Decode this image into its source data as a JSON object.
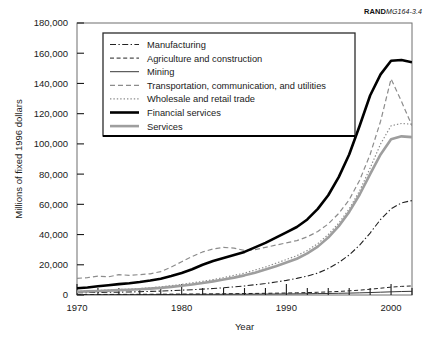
{
  "credit": {
    "brand": "RAND",
    "code": "MG164-3.4"
  },
  "chart_data": {
    "type": "line",
    "title": "",
    "xlabel": "Year",
    "ylabel": "Millions of fixed 1996 dollars",
    "xlim": [
      1970,
      2002
    ],
    "ylim": [
      0,
      180000
    ],
    "xticks": [
      1970,
      1980,
      1990,
      2000
    ],
    "xtick_labels": [
      "1970",
      "1980",
      "1990",
      "2000"
    ],
    "xminor_step": 2,
    "yticks": [
      0,
      20000,
      40000,
      60000,
      80000,
      100000,
      120000,
      140000,
      160000,
      180000
    ],
    "ytick_labels": [
      "0",
      "20,000",
      "40,000",
      "60,000",
      "80,000",
      "100,000",
      "120,000",
      "140,000",
      "160,000",
      "180,000"
    ],
    "grid": false,
    "legend_position": "upper-left-inset",
    "x": [
      1970,
      1971,
      1972,
      1973,
      1974,
      1975,
      1976,
      1977,
      1978,
      1979,
      1980,
      1981,
      1982,
      1983,
      1984,
      1985,
      1986,
      1987,
      1988,
      1989,
      1990,
      1991,
      1992,
      1993,
      1994,
      1995,
      1996,
      1997,
      1998,
      1999,
      2000,
      2001,
      2002
    ],
    "series": [
      {
        "name": "Manufacturing",
        "style": "dash-dot",
        "color": "#222222",
        "width": 1.1,
        "values": [
          1500,
          1600,
          1700,
          1800,
          1900,
          2000,
          2200,
          2400,
          2600,
          2900,
          3200,
          3500,
          3900,
          4300,
          4800,
          5400,
          6000,
          6800,
          7600,
          8600,
          9700,
          11000,
          12500,
          14500,
          17500,
          21500,
          26500,
          33000,
          41000,
          50000,
          57000,
          61000,
          62500
        ]
      },
      {
        "name": "Agriculture and construction",
        "style": "dashed",
        "color": "#222222",
        "width": 1.0,
        "values": [
          300,
          320,
          350,
          380,
          400,
          430,
          460,
          500,
          540,
          580,
          620,
          660,
          700,
          760,
          820,
          880,
          950,
          1030,
          1120,
          1220,
          1330,
          1450,
          1600,
          1800,
          2050,
          2350,
          2750,
          3200,
          3800,
          4500,
          5200,
          5700,
          6000
        ]
      },
      {
        "name": "Mining",
        "style": "solid",
        "color": "#222222",
        "width": 0.9,
        "values": [
          200,
          210,
          220,
          230,
          250,
          260,
          280,
          300,
          320,
          340,
          360,
          390,
          410,
          440,
          470,
          500,
          540,
          580,
          620,
          670,
          720,
          780,
          850,
          930,
          1020,
          1130,
          1260,
          1420,
          1620,
          1850,
          2100,
          2300,
          2450
        ]
      },
      {
        "name": "Transportation, communication, and utilities",
        "style": "dashed",
        "color": "#8c8c8c",
        "width": 1.2,
        "values": [
          11000,
          11500,
          12500,
          12000,
          13500,
          13000,
          13500,
          14000,
          15500,
          18500,
          22000,
          25500,
          28500,
          30500,
          31500,
          31000,
          29500,
          30000,
          31500,
          33000,
          34500,
          36000,
          38500,
          42000,
          47000,
          54000,
          63000,
          76000,
          93000,
          115000,
          143000,
          128000,
          112000
        ]
      },
      {
        "name": "Wholesale and retail trade",
        "style": "dotted",
        "color": "#8c8c8c",
        "width": 1.2,
        "values": [
          2500,
          2700,
          3000,
          3300,
          3600,
          3900,
          4300,
          4800,
          5400,
          6200,
          7000,
          8000,
          9000,
          10200,
          11500,
          13000,
          14500,
          16500,
          18500,
          21000,
          23500,
          26000,
          29500,
          34000,
          40000,
          47500,
          57000,
          69000,
          84000,
          100000,
          112000,
          113500,
          113000
        ]
      },
      {
        "name": "Financial services",
        "style": "solid",
        "color": "#000000",
        "width": 2.6,
        "values": [
          4500,
          5000,
          5800,
          6500,
          7200,
          7800,
          8600,
          9600,
          10800,
          12500,
          14500,
          17000,
          20000,
          22500,
          24500,
          26500,
          28500,
          31500,
          34500,
          38000,
          41500,
          45000,
          50000,
          57000,
          66000,
          78000,
          93000,
          112000,
          132000,
          146000,
          155000,
          155500,
          154000
        ]
      },
      {
        "name": "Services",
        "style": "solid",
        "color": "#9e9e9e",
        "width": 2.6,
        "values": [
          2200,
          2400,
          2650,
          2900,
          3200,
          3500,
          3800,
          4200,
          4700,
          5400,
          6100,
          7000,
          7900,
          9000,
          10200,
          11500,
          13000,
          14800,
          16800,
          19000,
          21500,
          24000,
          27500,
          32000,
          38000,
          45500,
          55000,
          66500,
          80000,
          93000,
          103000,
          105000,
          104500
        ]
      }
    ]
  },
  "legend": {
    "items": [
      {
        "label": "Manufacturing"
      },
      {
        "label": "Agriculture and construction"
      },
      {
        "label": "Mining"
      },
      {
        "label": "Transportation, communication, and utilities"
      },
      {
        "label": "Wholesale and retail trade"
      },
      {
        "label": "Financial services"
      },
      {
        "label": "Services"
      }
    ]
  }
}
